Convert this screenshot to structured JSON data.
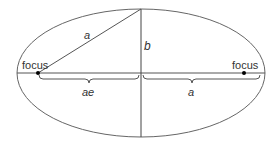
{
  "diagram": {
    "labels": {
      "focus_left": "focus",
      "focus_right": "focus",
      "semi_major_hyp": "a",
      "semi_minor": "b",
      "focal_distance": "ae",
      "semi_major": "a"
    },
    "geometry": {
      "center": [
        141,
        73
      ],
      "rx": 124,
      "ry": 64,
      "focus_left": [
        38,
        73
      ],
      "focus_right": [
        244,
        73
      ]
    },
    "colors": {
      "stroke": "#555555",
      "dot": "#000000",
      "text": "#333333"
    }
  }
}
